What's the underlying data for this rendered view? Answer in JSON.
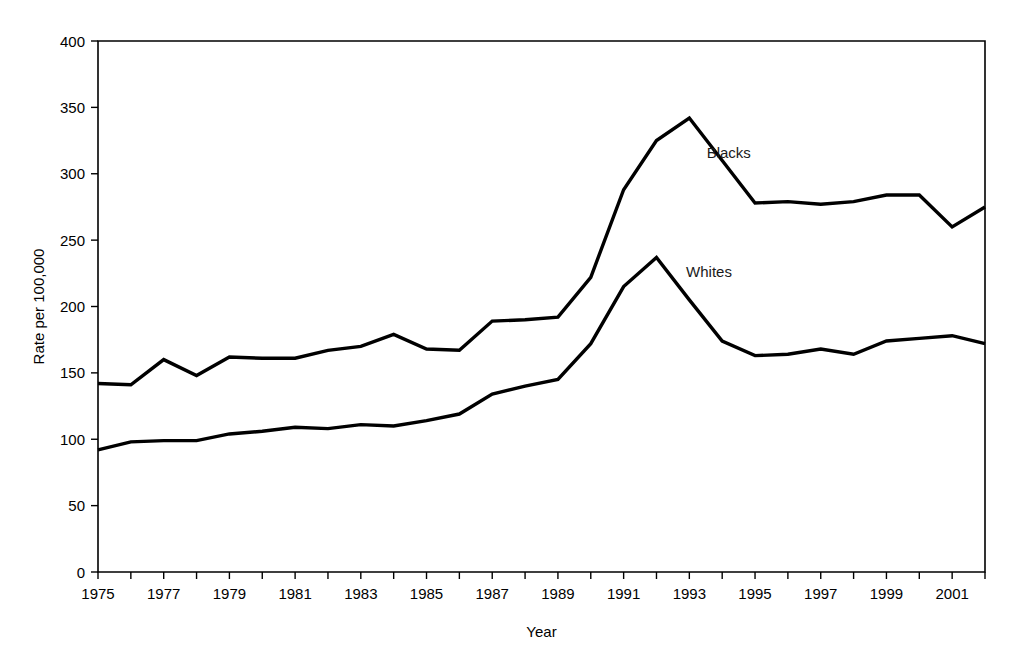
{
  "chart_data": {
    "type": "line",
    "title": "",
    "subtitle": "",
    "xlabel": "Year",
    "ylabel": "Rate per 100,000",
    "xlim": [
      1975,
      2002
    ],
    "ylim": [
      0,
      400
    ],
    "y_tick_step": 50,
    "x_tick_step": 1,
    "x_label_step": 2,
    "grid": false,
    "legend_position": "inline-annotations",
    "x": [
      1975,
      1976,
      1977,
      1978,
      1979,
      1980,
      1981,
      1982,
      1983,
      1984,
      1985,
      1986,
      1987,
      1988,
      1989,
      1990,
      1991,
      1992,
      1993,
      1994,
      1995,
      1996,
      1997,
      1998,
      1999,
      2000,
      2001,
      2002
    ],
    "y_ticks": [
      0,
      50,
      100,
      150,
      200,
      250,
      300,
      350,
      400
    ],
    "y_tick_labels": [
      "0",
      "50",
      "100",
      "150",
      "200",
      "250",
      "300",
      "350",
      "400"
    ],
    "x_tick_labels": [
      "1975",
      "",
      "1977",
      "",
      "1979",
      "",
      "1981",
      "",
      "1983",
      "",
      "1985",
      "",
      "1987",
      "",
      "1989",
      "",
      "1991",
      "",
      "1993",
      "",
      "1995",
      "",
      "1997",
      "",
      "1999",
      "",
      "2001",
      ""
    ],
    "series": [
      {
        "name": "Blacks",
        "label": "Blacks",
        "color": "#000000",
        "annotation_x": 1994.2,
        "annotation_y": 312,
        "values": [
          142,
          141,
          160,
          148,
          162,
          161,
          161,
          167,
          170,
          179,
          168,
          167,
          189,
          190,
          192,
          222,
          288,
          325,
          342,
          310,
          278,
          279,
          277,
          279,
          284,
          284,
          260,
          275
        ]
      },
      {
        "name": "Whites",
        "label": "Whites",
        "color": "#000000",
        "annotation_x": 1993.6,
        "annotation_y": 222,
        "values": [
          92,
          98,
          99,
          99,
          104,
          106,
          109,
          108,
          111,
          110,
          114,
          119,
          134,
          140,
          145,
          172,
          215,
          237,
          205,
          174,
          163,
          164,
          168,
          164,
          174,
          176,
          178,
          172
        ]
      }
    ]
  }
}
